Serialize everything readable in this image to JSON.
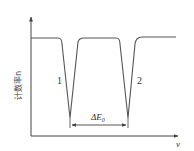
{
  "figure": {
    "y_axis_label": "计数率n",
    "x_axis_label": "v",
    "curve_labels": [
      "1",
      "2"
    ],
    "interval_label": "ΔE",
    "interval_subscript": "0",
    "colors": {
      "line": "#555555",
      "axis": "#444444",
      "background": "#ffffff"
    }
  }
}
